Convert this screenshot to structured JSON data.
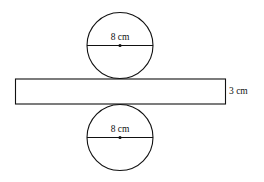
{
  "diagram": {
    "top_circle": {
      "diameter_label": "8 cm",
      "cx": 120,
      "cy": 45,
      "r": 33
    },
    "rectangle": {
      "height_label": "3 cm",
      "x": 15,
      "y": 79,
      "width": 211,
      "height": 25
    },
    "bottom_circle": {
      "diameter_label": "8 cm",
      "cx": 120,
      "cy": 137,
      "r": 33
    },
    "stroke_color": "#111111"
  }
}
